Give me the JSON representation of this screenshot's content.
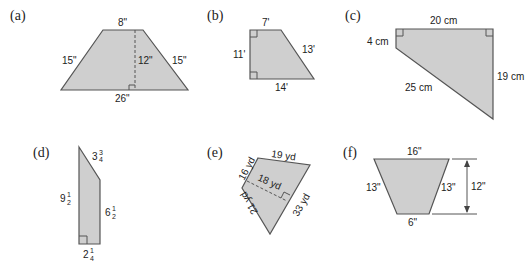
{
  "figures": [
    {
      "label": "(a)",
      "shape": "isosceles trapezoid",
      "dimensions": {
        "top": "8\"",
        "left": "15\"",
        "height": "12\"",
        "right": "15\"",
        "bottom": "26\""
      }
    },
    {
      "label": "(b)",
      "shape": "right trapezoid",
      "dimensions": {
        "top": "7'",
        "left": "11'",
        "right": "13'",
        "bottom": "14'"
      }
    },
    {
      "label": "(c)",
      "shape": "right trapezoid",
      "dimensions": {
        "top": "20 cm",
        "left": "4 cm",
        "right": "19 cm",
        "slant": "25 cm"
      }
    },
    {
      "label": "(d)",
      "shape": "right trapezoid",
      "dimensions": {
        "top_slant": {
          "whole": "3",
          "num": "3",
          "den": "4"
        },
        "left": {
          "whole": "9",
          "num": "1",
          "den": "2"
        },
        "right": {
          "whole": "6",
          "num": "1",
          "den": "2"
        },
        "bottom": {
          "whole": "2",
          "num": "1",
          "den": "4"
        }
      }
    },
    {
      "label": "(e)",
      "shape": "quadrilateral",
      "dimensions": {
        "top": "19 yd",
        "upper_left": "16 yd",
        "diagonal": "18 yd",
        "right": "33 yd",
        "lower_left": "21 yd"
      }
    },
    {
      "label": "(f)",
      "shape": "isosceles trapezoid",
      "dimensions": {
        "top": "16\"",
        "left": "13\"",
        "right": "13\"",
        "height": "12\"",
        "bottom": "6\""
      }
    }
  ]
}
